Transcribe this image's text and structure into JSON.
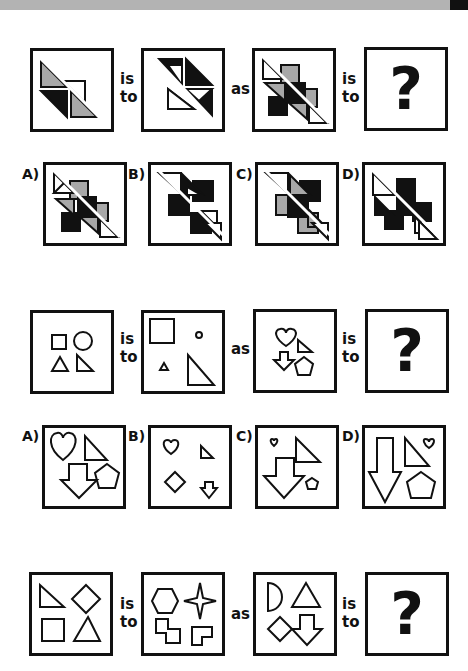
{
  "header": {
    "bar_color": "#b3b3b3",
    "corner_color": "#111111"
  },
  "connectors": {
    "is": "is",
    "to": "to",
    "as": "as"
  },
  "question_mark": "?",
  "puzzles": [
    {
      "id": 1,
      "description": "Triangle arrangement analogy",
      "panels": [
        "gray/white/black triangles along diagonal",
        "rotated triangle arrangement",
        "stacked triangles with squares",
        "?"
      ],
      "options": [
        {
          "label": "A)"
        },
        {
          "label": "B)"
        },
        {
          "label": "C)"
        },
        {
          "label": "D)"
        }
      ]
    },
    {
      "id": 2,
      "description": "Shape size change analogy",
      "panels": [
        "square, circle, triangle, right triangle",
        "large square, small circle, small triangle, large right triangle",
        "heart, right triangle, down arrow, pentagon",
        "?"
      ],
      "options": [
        {
          "label": "A)"
        },
        {
          "label": "B)"
        },
        {
          "label": "C)"
        },
        {
          "label": "D)"
        }
      ]
    },
    {
      "id": 3,
      "description": "Shape substitution analogy",
      "panels": [
        "right triangle, diamond, square, triangle",
        "hexagon, four-point star, stepped shape, L shape",
        "half-circle, triangle, diamond, down arrow",
        "?"
      ]
    }
  ],
  "colors": {
    "black": "#111111",
    "gray": "#a8a8a8",
    "white": "#ffffff"
  }
}
